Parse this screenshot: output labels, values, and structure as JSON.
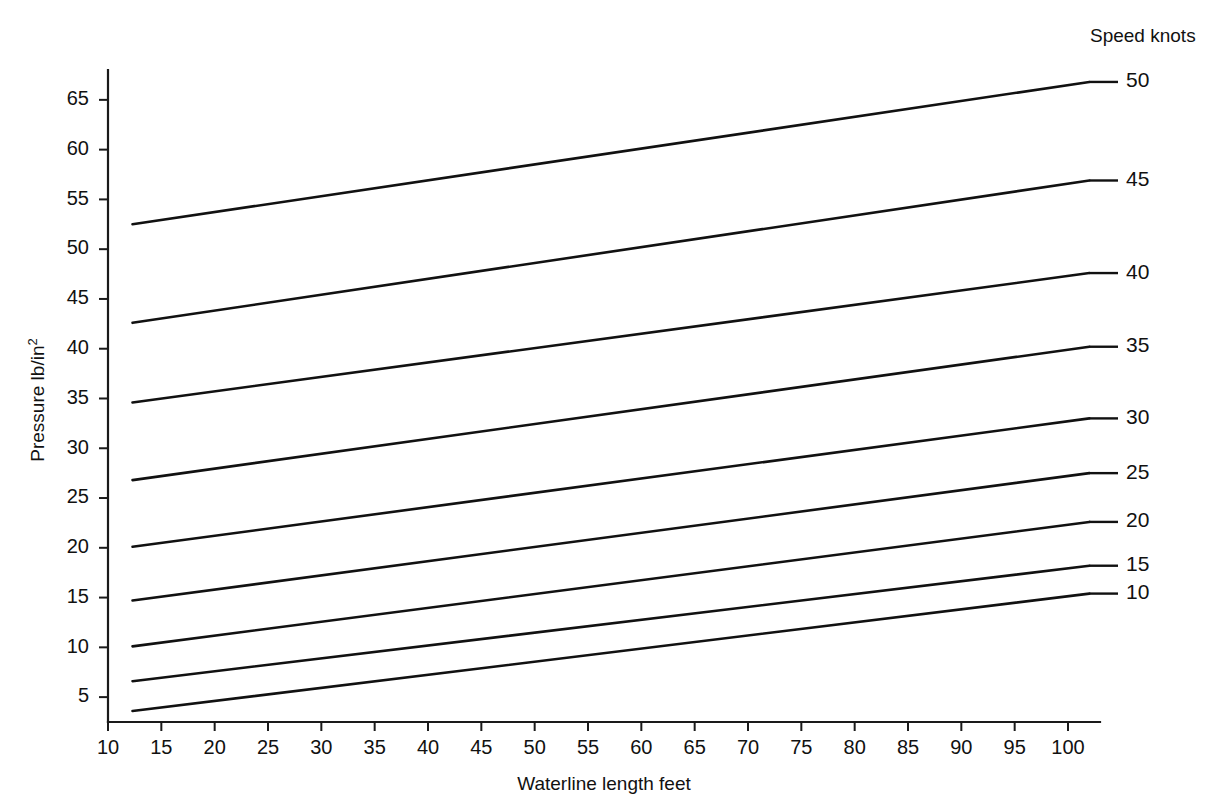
{
  "chart_data": {
    "type": "line",
    "title": "",
    "subtitle": "",
    "xlabel": "Waterline length feet",
    "ylabel": "Pressure lb/in",
    "ylabel_superscript": "2",
    "legend_title": "Speed knots",
    "legend_position": "right-of-plot-line-ends",
    "grid": false,
    "xlim": [
      10,
      103
    ],
    "ylim": [
      2.5,
      68
    ],
    "xticks": [
      10,
      15,
      20,
      25,
      30,
      35,
      40,
      45,
      50,
      55,
      60,
      65,
      70,
      75,
      80,
      85,
      90,
      95,
      100
    ],
    "yticks": [
      5,
      10,
      15,
      20,
      25,
      30,
      35,
      40,
      45,
      50,
      55,
      60,
      65
    ],
    "xtick_labels": [
      "10",
      "15",
      "20",
      "25",
      "30",
      "35",
      "40",
      "45",
      "50",
      "55",
      "60",
      "65",
      "70",
      "75",
      "80",
      "85",
      "90",
      "95",
      "100"
    ],
    "ytick_labels": [
      "5",
      "10",
      "15",
      "20",
      "25",
      "30",
      "35",
      "40",
      "45",
      "50",
      "55",
      "60",
      "65"
    ],
    "x": [
      12.3,
      102.0
    ],
    "series": [
      {
        "name": "50",
        "label": "50",
        "values": [
          52.5,
          66.8
        ],
        "color": "#111111"
      },
      {
        "name": "45",
        "label": "45",
        "values": [
          42.6,
          56.9
        ],
        "color": "#111111"
      },
      {
        "name": "40",
        "label": "40",
        "values": [
          34.6,
          47.6
        ],
        "color": "#111111"
      },
      {
        "name": "35",
        "label": "35",
        "values": [
          26.8,
          40.2
        ],
        "color": "#111111"
      },
      {
        "name": "30",
        "label": "30",
        "values": [
          20.1,
          33.0
        ],
        "color": "#111111"
      },
      {
        "name": "25",
        "label": "25",
        "values": [
          14.7,
          27.5
        ],
        "color": "#111111"
      },
      {
        "name": "20",
        "label": "20",
        "values": [
          10.1,
          22.6
        ],
        "color": "#111111"
      },
      {
        "name": "15",
        "label": "15",
        "values": [
          6.6,
          18.2
        ],
        "color": "#111111"
      },
      {
        "name": "10",
        "label": "10",
        "values": [
          3.6,
          15.4
        ],
        "color": "#111111"
      }
    ]
  },
  "axes": {
    "x_title": "Waterline length feet",
    "y_title_main": "Pressure lb/in",
    "y_title_sup": "2"
  },
  "legend": {
    "title": "Speed knots",
    "entries": [
      "50",
      "45",
      "40",
      "35",
      "30",
      "25",
      "20",
      "15",
      "10"
    ]
  }
}
